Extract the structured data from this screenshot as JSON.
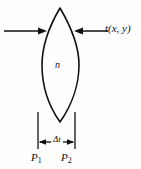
{
  "figure": {
    "type": "optics-lens-diagram",
    "background_color": "#fefefe",
    "line_color": "#111111",
    "labels": {
      "thickness_function": "t(x, y)",
      "index_of_refraction": "n",
      "delta_thickness": "Δt",
      "plane_1": "P",
      "plane_1_sub": "1",
      "plane_2": "P",
      "plane_2_sub": "2"
    },
    "geometry": {
      "lens_top_tip_x": 60,
      "lens_top_tip_y": 8,
      "lens_bottom_tip_x": 60,
      "lens_bottom_tip_y": 122,
      "lens_left_extent_x": 42,
      "lens_right_extent_x": 79,
      "lens_mid_y": 65,
      "arrow_row_y": 31,
      "left_arrow_start_x": 4,
      "left_arrow_end_x": 46,
      "right_arrow_start_x": 108,
      "right_arrow_end_x": 75,
      "dim_line_left_x": 38,
      "dim_line_right_x": 75,
      "dim_line_top_y": 112,
      "dim_line_bottom_y": 149,
      "dim_arrow_y": 142
    }
  }
}
